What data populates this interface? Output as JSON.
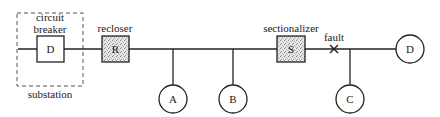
{
  "diagram": {
    "type": "distribution-feeder-protection",
    "colors": {
      "line": "#222222",
      "background": "#ffffff",
      "dashed_box": "#555555",
      "device_fill": "#d8d8d8"
    },
    "substation": {
      "label": "substation"
    },
    "circuit_breaker": {
      "label_line1": "circuit",
      "label_line2": "breaker",
      "symbol": "D"
    },
    "recloser": {
      "label": "recloser",
      "symbol": "R"
    },
    "sectionalizer": {
      "label": "sectionalizer",
      "symbol": "S"
    },
    "fault": {
      "label": "fault",
      "marker": "×"
    },
    "loads": [
      {
        "id": "A",
        "label": "A"
      },
      {
        "id": "B",
        "label": "B"
      },
      {
        "id": "C",
        "label": "C"
      },
      {
        "id": "D",
        "label": "D"
      }
    ]
  }
}
